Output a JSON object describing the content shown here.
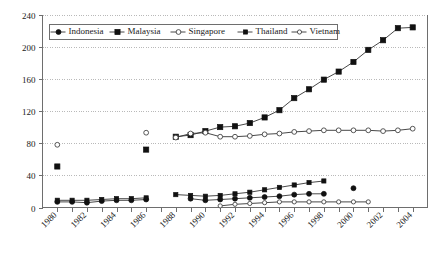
{
  "chart_data": {
    "type": "line",
    "title": "",
    "xlabel": "",
    "ylabel": "",
    "xlim": [
      1979,
      2005
    ],
    "ylim": [
      0,
      240
    ],
    "yticks": [
      0,
      40,
      80,
      120,
      160,
      200,
      240
    ],
    "xticks": [
      1980,
      1982,
      1984,
      1986,
      1988,
      1990,
      1992,
      1994,
      1996,
      1998,
      2000,
      2002,
      2004
    ],
    "xtick_labels": [
      "1980",
      "1982",
      "1984",
      "1986",
      "1988",
      "1990",
      "1992",
      "1994",
      "1996",
      "1998",
      "2000",
      "2002",
      "2004"
    ],
    "ytick_labels": [
      "0",
      "40",
      "80",
      "120",
      "160",
      "200",
      "240"
    ],
    "grid": "horizontal-dotted",
    "legend_position": "top-inside-left",
    "series": [
      {
        "name": "Indonesia",
        "marker": "filled-circle",
        "line": true,
        "x": [
          1980,
          1981,
          1982,
          1983,
          1984,
          1985,
          1986,
          1989,
          1990,
          1991,
          1992,
          1993,
          1994,
          1995,
          1996,
          1997,
          1998,
          2000
        ],
        "values": [
          7,
          7,
          6,
          8,
          9,
          9,
          10,
          11,
          9,
          10,
          11,
          12,
          13,
          14,
          16,
          17,
          17,
          24
        ]
      },
      {
        "name": "Malaysia",
        "marker": "filled-square",
        "line": true,
        "x": [
          1980,
          1986,
          1988,
          1989,
          1990,
          1991,
          1992,
          1993,
          1994,
          1995,
          1996,
          1997,
          1998,
          1999,
          2000,
          2001,
          2002,
          2003,
          2004
        ],
        "values": [
          51,
          72,
          88,
          90,
          95,
          100,
          101,
          105,
          112,
          121,
          136,
          147,
          159,
          169,
          181,
          196,
          208,
          223,
          224
        ]
      },
      {
        "name": "Singapore",
        "marker": "open-circle",
        "line": true,
        "x": [
          1980,
          1986,
          1988,
          1989,
          1990,
          1991,
          1992,
          1993,
          1994,
          1995,
          1996,
          1997,
          1998,
          1999,
          2000,
          2001,
          2002,
          2003,
          2004
        ],
        "values": [
          78,
          93,
          87,
          92,
          93,
          88,
          88,
          89,
          91,
          92,
          94,
          95,
          96,
          96,
          96,
          96,
          95,
          96,
          98
        ]
      },
      {
        "name": "Thailand",
        "marker": "filled-square-small",
        "line": true,
        "x": [
          1980,
          1981,
          1982,
          1983,
          1984,
          1985,
          1986,
          1988,
          1989,
          1990,
          1991,
          1992,
          1993,
          1994,
          1995,
          1996,
          1997,
          1998
        ],
        "values": [
          9,
          9,
          9,
          10,
          11,
          11,
          12,
          16,
          15,
          14,
          15,
          17,
          19,
          22,
          25,
          28,
          31,
          33
        ]
      },
      {
        "name": "Vietnam",
        "marker": "open-circle-small",
        "line": true,
        "x": [
          1991,
          1992,
          1993,
          1994,
          1995,
          1996,
          1997,
          1998,
          1999,
          2000,
          2001
        ],
        "values": [
          2,
          4,
          5,
          6,
          7,
          7,
          7,
          7,
          7,
          7,
          7
        ]
      }
    ],
    "legend": [
      {
        "label": "Indonesia",
        "marker": "filled-circle"
      },
      {
        "label": "Malaysia",
        "marker": "filled-square"
      },
      {
        "label": "Singapore",
        "marker": "open-circle"
      },
      {
        "label": "Thailand",
        "marker": "filled-square-small"
      },
      {
        "label": "Vietnam",
        "marker": "open-circle-small"
      }
    ],
    "colors": {
      "line": "#333333",
      "marker_fill": "#111111",
      "marker_open": "#ffffff",
      "axis": "#6e6e6e",
      "grid": "#b9b9b9",
      "background": "#ffffff"
    }
  }
}
